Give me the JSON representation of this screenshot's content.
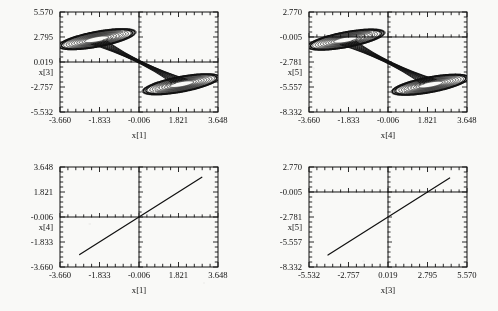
{
  "figure": {
    "background_color": "#f9f9f7",
    "ink_color": "#111111",
    "panel_count": 4,
    "layout": "2x2 grid"
  },
  "chart_data": [
    {
      "type": "line",
      "panel": "top-left",
      "title": "",
      "xlabel": "x[1]",
      "ylabel": "x[3]",
      "xlim": [
        -3.66,
        3.648
      ],
      "ylim": [
        -5.532,
        5.57
      ],
      "xticks": [
        -3.66,
        -1.833,
        -0.006,
        1.821,
        3.648
      ],
      "xticklabels": [
        "-3.660",
        "-1.833",
        "-0.006",
        "1.821",
        "3.648"
      ],
      "yticks": [
        -5.532,
        -2.757,
        0.019,
        2.795,
        5.57
      ],
      "yticklabels": [
        "-5.532",
        "-2.757",
        "0.019",
        "2.795",
        "5.570"
      ],
      "minor_ticks_per_interval": 5,
      "grid": false,
      "zero_axes": true,
      "zero_x": -0.006,
      "zero_y": 0.019,
      "description": "double-scroll chaotic attractor projection, two lobes on the anti-diagonal",
      "lobes": [
        {
          "center_x": -1.95,
          "center_y": 2.55,
          "rx": 0.78,
          "ry": 1.95,
          "tilt_deg": -62
        },
        {
          "center_x": 1.95,
          "center_y": -2.45,
          "rx": 0.78,
          "ry": 1.95,
          "tilt_deg": -62
        }
      ],
      "trajectory_turns": 11
    },
    {
      "type": "line",
      "panel": "top-right",
      "title": "",
      "xlabel": "x[4]",
      "ylabel": "x[5]",
      "xlim": [
        -3.66,
        3.648
      ],
      "ylim": [
        -8.332,
        2.77
      ],
      "xticks": [
        -3.66,
        -1.833,
        -0.006,
        1.821,
        3.648
      ],
      "xticklabels": [
        "-3.660",
        "-1.833",
        "-0.006",
        "1.821",
        "3.648"
      ],
      "yticks": [
        -8.332,
        -5.557,
        -2.781,
        -0.005,
        2.77
      ],
      "yticklabels": [
        "-8.332",
        "-5.557",
        "-2.781",
        "-0.005",
        "2.770"
      ],
      "minor_ticks_per_interval": 5,
      "grid": false,
      "zero_axes": true,
      "zero_x": -0.006,
      "zero_y": -0.005,
      "description": "double-scroll chaotic attractor projection, two lobes on the anti-diagonal",
      "lobes": [
        {
          "center_x": -1.95,
          "center_y": -0.3,
          "rx": 0.78,
          "ry": 1.95,
          "tilt_deg": -62
        },
        {
          "center_x": 1.95,
          "center_y": -5.3,
          "rx": 0.78,
          "ry": 1.95,
          "tilt_deg": -62
        }
      ],
      "trajectory_turns": 11
    },
    {
      "type": "line",
      "panel": "bottom-left",
      "title": "",
      "xlabel": "x[1]",
      "ylabel": "x[4]",
      "xlim": [
        -3.66,
        3.648
      ],
      "ylim": [
        -3.66,
        3.648
      ],
      "xticks": [
        -3.66,
        -1.833,
        -0.006,
        1.821,
        3.648
      ],
      "xticklabels": [
        "-3.660",
        "-1.833",
        "-0.006",
        "1.821",
        "3.648"
      ],
      "yticks": [
        -3.66,
        -1.833,
        -0.006,
        1.821,
        3.648
      ],
      "yticklabels": [
        "-3.660",
        "-1.833",
        "-0.006",
        "1.821",
        "3.648"
      ],
      "minor_ticks_per_interval": 5,
      "grid": false,
      "zero_axes": true,
      "zero_x": -0.006,
      "zero_y": -0.006,
      "description": "straight synchronization line, slope 1, passing through the origin",
      "line": {
        "x_start": -2.75,
        "y_start": -2.75,
        "x_end": 2.9,
        "y_end": 2.9
      }
    },
    {
      "type": "line",
      "panel": "bottom-right",
      "title": "",
      "xlabel": "x[3]",
      "ylabel": "x[5]",
      "xlim": [
        -5.532,
        5.57
      ],
      "ylim": [
        -8.332,
        2.77
      ],
      "xticks": [
        -5.532,
        -2.757,
        0.019,
        2.795,
        5.57
      ],
      "xticklabels": [
        "-5.532",
        "-2.757",
        "0.019",
        "2.795",
        "5.570"
      ],
      "yticks": [
        -8.332,
        -5.557,
        -2.781,
        -0.005,
        2.77
      ],
      "yticklabels": [
        "-8.332",
        "-5.557",
        "-2.781",
        "-0.005",
        "2.770"
      ],
      "minor_ticks_per_interval": 5,
      "grid": false,
      "zero_axes": true,
      "zero_x": 0.019,
      "zero_y": -0.005,
      "description": "straight synchronization line, slope 1, offset downward by about 2.8",
      "line": {
        "x_start": -4.2,
        "y_start": -7.0,
        "x_end": 4.35,
        "y_end": 1.55
      }
    }
  ]
}
